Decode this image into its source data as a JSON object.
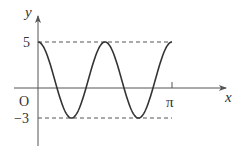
{
  "chart_data": {
    "type": "line",
    "title": "",
    "function": "y = 4cos(4x) + 1",
    "xlabel": "x",
    "ylabel": "y",
    "origin_label": "O",
    "x_ticks": [
      {
        "value": 3.14159,
        "label": "π"
      }
    ],
    "y_ticks": [
      {
        "value": 5,
        "label": "5"
      },
      {
        "value": -3,
        "label": "-3"
      }
    ],
    "xlim": [
      0,
      3.14159
    ],
    "ylim": [
      -3,
      5
    ],
    "max_value": 5,
    "min_value": -3,
    "reference_lines": [
      {
        "type": "horizontal",
        "y": 5,
        "style": "dashed"
      },
      {
        "type": "horizontal",
        "y": -3,
        "style": "dashed"
      }
    ],
    "key_points": [
      {
        "x": 0,
        "y": 5
      },
      {
        "x": 0.785,
        "y": -3
      },
      {
        "x": 1.571,
        "y": 5
      },
      {
        "x": 2.356,
        "y": -3
      },
      {
        "x": 3.14159,
        "y": 5
      }
    ],
    "grid": false,
    "legend": null
  },
  "labels": {
    "y_axis": "y",
    "x_axis": "x",
    "origin": "O",
    "y_max": "5",
    "y_min": "−3",
    "x_pi": "π"
  },
  "colors": {
    "curve": "#333333",
    "axis": "#555555",
    "dashed": "#555555"
  }
}
